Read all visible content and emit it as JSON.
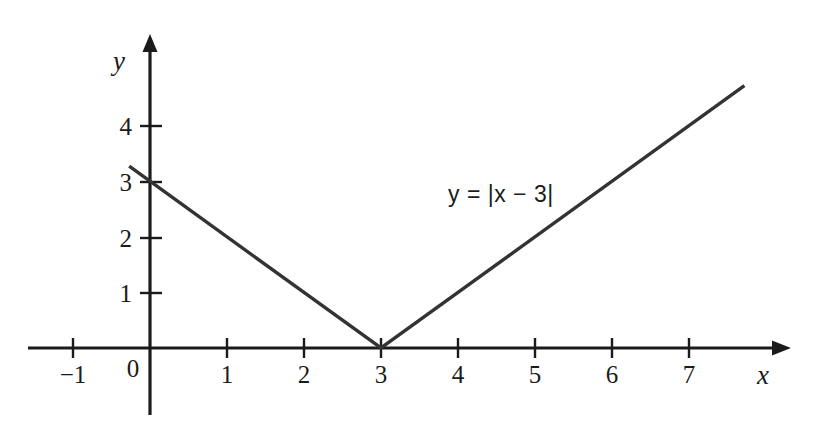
{
  "chart_data": {
    "type": "line",
    "title": "",
    "subtitle": "",
    "xlabel": "x",
    "ylabel": "y",
    "function": "y = |x - 3|",
    "annotation": "y = |x − 3|",
    "annotation_parts": {
      "lhs_var": "y",
      "equals": "=",
      "bar_open": "|",
      "rhs_var": "x",
      "minus": "−",
      "constant": "3",
      "bar_close": "|"
    },
    "xlim": [
      -1.6,
      8.2
    ],
    "ylim": [
      -1.2,
      5.7
    ],
    "x_ticks": [
      -1,
      0,
      1,
      2,
      3,
      4,
      5,
      6,
      7
    ],
    "x_tick_labels": [
      "−1",
      "0",
      "1",
      "2",
      "3",
      "4",
      "5",
      "6",
      "7"
    ],
    "y_ticks": [
      1,
      2,
      3,
      4
    ],
    "y_tick_labels": [
      "1",
      "2",
      "3",
      "4"
    ],
    "grid": false,
    "legend": "none",
    "vertex": [
      3,
      0
    ],
    "x": [
      -0.27,
      0,
      1,
      2,
      3,
      4,
      5,
      6,
      7,
      7.72
    ],
    "y": [
      3.27,
      3,
      2,
      1,
      0,
      1,
      2,
      3,
      4,
      4.72
    ],
    "series": [
      {
        "name": "y = |x - 3|",
        "color": "#333333",
        "x": [
          -0.27,
          3,
          7.72
        ],
        "values": [
          3.27,
          0,
          4.72
        ]
      }
    ],
    "axis_style": {
      "arrowed": true,
      "color": "#1b1b1b",
      "line_color": "#333333"
    }
  },
  "labels": {
    "x_axis_name": "x",
    "y_axis_name": "y",
    "x_ticks": [
      "−1",
      "0",
      "1",
      "2",
      "3",
      "4",
      "5",
      "6",
      "7"
    ],
    "y_ticks": [
      "1",
      "2",
      "3",
      "4"
    ],
    "equation": "y = |x − 3|"
  },
  "colors": {
    "background": "#ffffff",
    "axis": "#1b1b1b",
    "curve": "#333333",
    "text": "#1b1b1b"
  }
}
